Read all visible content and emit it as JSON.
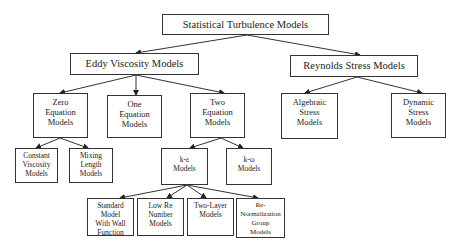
{
  "diagram": {
    "type": "hierarchy-tree",
    "colors": {
      "line": "#333333",
      "box_border": "#333333",
      "text": "#222222",
      "background": "#ffffff"
    },
    "nodes": {
      "root": {
        "label": "Statistical Turbulence Models",
        "x": 162,
        "y": 14,
        "w": 167,
        "h": 21
      },
      "eddy": {
        "label": "Eddy Viscosity Models",
        "x": 70,
        "y": 53,
        "w": 129,
        "h": 22
      },
      "reynolds": {
        "label": "Reynolds Stress Models",
        "x": 290,
        "y": 55,
        "w": 128,
        "h": 22
      },
      "zero": {
        "label": "Zero\nEquation\nModels",
        "x": 33,
        "y": 93,
        "w": 55,
        "h": 45
      },
      "one": {
        "label": "One\nEquation\nModels",
        "x": 107,
        "y": 95,
        "w": 55,
        "h": 43
      },
      "two": {
        "label": "Two\nEquation\nModels",
        "x": 190,
        "y": 93,
        "w": 55,
        "h": 45
      },
      "algebraic": {
        "label": "Algebraic\nStress\nModels",
        "x": 281,
        "y": 93,
        "w": 57,
        "h": 46
      },
      "dynamic": {
        "label": "Dynamic\nStress\nModels",
        "x": 391,
        "y": 93,
        "w": 55,
        "h": 45
      },
      "constant": {
        "label": "Constant\nViscosity\nModels",
        "x": 15,
        "y": 148,
        "w": 43,
        "h": 35
      },
      "mixing": {
        "label": "Mixing\nLength\nModels",
        "x": 69,
        "y": 148,
        "w": 44,
        "h": 35
      },
      "keps": {
        "label": "k-ε\nModels",
        "x": 161,
        "y": 148,
        "w": 47,
        "h": 37
      },
      "komega": {
        "label": "k-ω\nModels",
        "x": 226,
        "y": 148,
        "w": 46,
        "h": 37
      },
      "standard": {
        "label": "Standard\nModel\nWith Wall\nFunction",
        "x": 87,
        "y": 198,
        "w": 47,
        "h": 38
      },
      "lowre": {
        "label": "Low Re\nNumber\nModels",
        "x": 137,
        "y": 198,
        "w": 47,
        "h": 38
      },
      "twolayer": {
        "label": "Two-Layer\nModels",
        "x": 187,
        "y": 198,
        "w": 47,
        "h": 38
      },
      "renorm": {
        "label": "Re-\nNormalization\nGroup\nModels",
        "x": 236,
        "y": 198,
        "w": 49,
        "h": 40
      }
    },
    "edges": [
      {
        "from": "root",
        "to": "eddy",
        "x1": 247,
        "y1": 35,
        "x2": 136,
        "y2": 53
      },
      {
        "from": "root",
        "to": "reynolds",
        "x1": 247,
        "y1": 35,
        "x2": 360,
        "y2": 55
      },
      {
        "from": "eddy",
        "to": "zero",
        "x1": 136,
        "y1": 75,
        "x2": 60,
        "y2": 93
      },
      {
        "from": "eddy",
        "to": "one",
        "x1": 136,
        "y1": 75,
        "x2": 136,
        "y2": 95
      },
      {
        "from": "eddy",
        "to": "two",
        "x1": 136,
        "y1": 75,
        "x2": 224,
        "y2": 93
      },
      {
        "from": "reynolds",
        "to": "algebraic",
        "x1": 357,
        "y1": 77,
        "x2": 305,
        "y2": 93
      },
      {
        "from": "reynolds",
        "to": "dynamic",
        "x1": 357,
        "y1": 77,
        "x2": 422,
        "y2": 93
      },
      {
        "from": "zero",
        "to": "constant",
        "x1": 60,
        "y1": 138,
        "x2": 36,
        "y2": 148
      },
      {
        "from": "zero",
        "to": "mixing",
        "x1": 60,
        "y1": 138,
        "x2": 88,
        "y2": 148
      },
      {
        "from": "two",
        "to": "keps",
        "x1": 221,
        "y1": 138,
        "x2": 190,
        "y2": 148
      },
      {
        "from": "two",
        "to": "komega",
        "x1": 221,
        "y1": 138,
        "x2": 243,
        "y2": 148
      },
      {
        "from": "keps",
        "to": "standard",
        "x1": 187,
        "y1": 185,
        "x2": 120,
        "y2": 198
      },
      {
        "from": "keps",
        "to": "lowre",
        "x1": 187,
        "y1": 185,
        "x2": 167,
        "y2": 198
      },
      {
        "from": "keps",
        "to": "twolayer",
        "x1": 187,
        "y1": 185,
        "x2": 206,
        "y2": 198
      },
      {
        "from": "keps",
        "to": "renorm",
        "x1": 187,
        "y1": 185,
        "x2": 258,
        "y2": 198
      }
    ]
  }
}
